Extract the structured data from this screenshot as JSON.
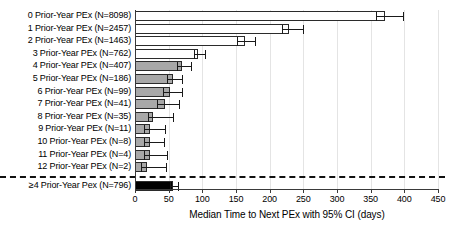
{
  "chart_data": {
    "type": "bar",
    "orientation": "horizontal",
    "title": "",
    "xlabel": "Median Time to Next PEx with 95% CI (days)",
    "ylabel": "",
    "xlim": [
      0,
      450
    ],
    "xticks": [
      0,
      50,
      100,
      150,
      200,
      250,
      300,
      350,
      400,
      450
    ],
    "grid": "vertical-light",
    "legend": "none",
    "separator_note": "dashed horizontal line above final pooled row",
    "categories": [
      "0 Prior-Year PEx (N=8098)",
      "1 Prior-Year PEx (N=2457)",
      "2 Prior-Year PEx (N=1463)",
      "3 Prior-Year PEx (N=762)",
      "4 Prior-Year PEx (N=407)",
      "5 Prior-Year PEx (N=186)",
      "6 Prior-Year PEx (N=99)",
      "7 Prior-Year PEx (N=41)",
      "8 Prior-Year PEx (N=35)",
      "9 Prior-Year PEx (N=11)",
      "10 Prior-Year PEx (N=8)",
      "11 Prior-Year PEx (N=4)",
      "12 Prior-Year PEx (N=2)",
      "≥4 Prior-Year Pex (N=796)"
    ],
    "values": [
      372,
      229,
      163,
      94,
      70,
      57,
      52,
      45,
      27,
      22,
      23,
      23,
      18,
      57
    ],
    "ci_low": [
      358,
      219,
      152,
      87,
      62,
      48,
      42,
      32,
      20,
      14,
      13,
      13,
      9,
      52
    ],
    "ci_high": [
      398,
      250,
      178,
      104,
      83,
      70,
      70,
      66,
      56,
      44,
      43,
      47,
      46,
      64
    ],
    "bar_fills": [
      "white",
      "white",
      "white",
      "white",
      "gray",
      "gray",
      "gray",
      "gray",
      "gray",
      "gray",
      "gray",
      "gray",
      "gray",
      "black"
    ],
    "n_values": [
      8098,
      2457,
      1463,
      762,
      407,
      186,
      99,
      41,
      35,
      11,
      8,
      4,
      2,
      796
    ]
  },
  "colors": {
    "bar_white": "#ffffff",
    "bar_gray": "#a8a8a8",
    "bar_black": "#000000",
    "bar_edge": "#2b2b2b",
    "axis": "#3a3a3a",
    "grid": "#e4e4e4",
    "error_bar": "#1a1a1a",
    "separator": "#111111",
    "text": "#000000",
    "background": "#ffffff"
  }
}
